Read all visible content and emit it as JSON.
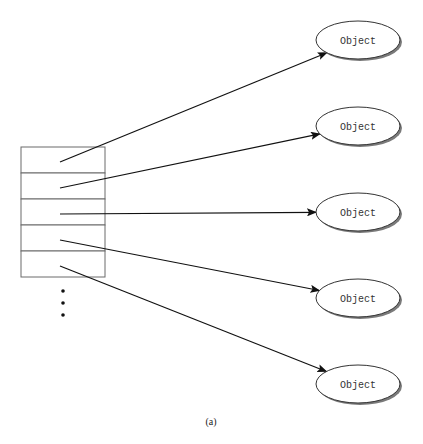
{
  "diagram": {
    "caption": "(a)",
    "array_cells": 5,
    "objects": [
      {
        "label": "Object"
      },
      {
        "label": "Object"
      },
      {
        "label": "Object"
      },
      {
        "label": "Object"
      },
      {
        "label": "Object"
      }
    ],
    "pointers": [
      {
        "from_cell": 0,
        "to_object": 0
      },
      {
        "from_cell": 1,
        "to_object": 1
      },
      {
        "from_cell": 2,
        "to_object": 2
      },
      {
        "from_cell": 3,
        "to_object": 3
      },
      {
        "from_cell": 4,
        "to_object": 4
      }
    ],
    "continuation": "ellipsis-dots"
  }
}
